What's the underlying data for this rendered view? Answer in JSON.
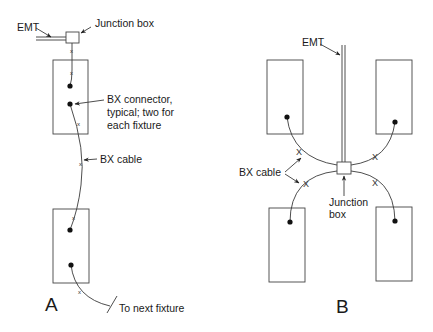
{
  "diagram": {
    "panel_a": {
      "label": "A",
      "labels": {
        "emt": "EMT",
        "junction_box": "Junction box",
        "bx_connector_line1": "BX connector,",
        "bx_connector_line2": "typical; two for",
        "bx_connector_line3": "each fixture",
        "bx_cable": "BX cable",
        "to_next_fixture": "To next fixture"
      },
      "fixtures": [
        {
          "x": 53,
          "y": 60,
          "w": 35,
          "h": 74
        },
        {
          "x": 53,
          "y": 209,
          "w": 36,
          "h": 74
        }
      ]
    },
    "panel_b": {
      "label": "B",
      "labels": {
        "emt": "EMT",
        "bx_cable": "BX cable",
        "junction_box_line1": "Junction",
        "junction_box_line2": "box"
      },
      "fixtures": [
        {
          "x": 267,
          "y": 60,
          "w": 36,
          "h": 74
        },
        {
          "x": 376,
          "y": 60,
          "w": 36,
          "h": 74
        },
        {
          "x": 269,
          "y": 208,
          "w": 36,
          "h": 74
        },
        {
          "x": 376,
          "y": 207,
          "w": 36,
          "h": 74
        }
      ]
    }
  }
}
